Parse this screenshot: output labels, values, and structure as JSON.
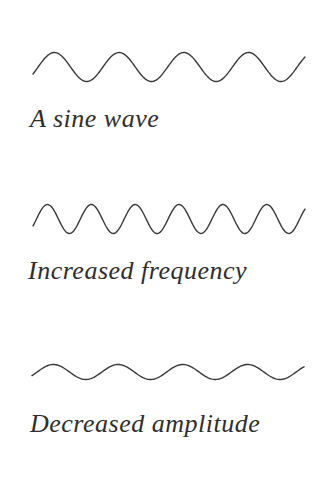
{
  "page": {
    "background_color": "#ffffff",
    "line_color": "#3a3a3a",
    "text_color": "#2e2e2e"
  },
  "diagram": {
    "stroke_width": 1.4,
    "phase_start_rad": -0.5,
    "waves": [
      {
        "label": "A sine wave",
        "cycles": 4.2,
        "amplitude_px": 14.5,
        "center_y_px": 67,
        "x_start_px": 33,
        "x_end_px": 305
      },
      {
        "label": "Increased frequency",
        "cycles": 6.2,
        "amplitude_px": 14.5,
        "center_y_px": 219,
        "x_start_px": 33,
        "x_end_px": 305
      },
      {
        "label": "Decreased amplitude",
        "cycles": 4.2,
        "amplitude_px": 7.5,
        "center_y_px": 372,
        "x_start_px": 32,
        "x_end_px": 304
      }
    ]
  }
}
